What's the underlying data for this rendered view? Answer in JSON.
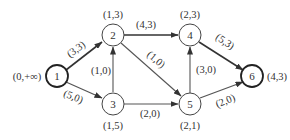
{
  "diagram": {
    "type": "directed-flow-network",
    "nodes": [
      {
        "id": "1",
        "label": "1",
        "mark": "(0,+∞)",
        "thick": true
      },
      {
        "id": "2",
        "label": "2",
        "mark": "(1,3)",
        "thick": false
      },
      {
        "id": "3",
        "label": "3",
        "mark": "(1,5)",
        "thick": false
      },
      {
        "id": "4",
        "label": "4",
        "mark": "(2,3)",
        "thick": false
      },
      {
        "id": "5",
        "label": "5",
        "mark": "(2,1)",
        "thick": false
      },
      {
        "id": "6",
        "label": "6",
        "mark": "(4,3)",
        "thick": true
      }
    ],
    "edges": [
      {
        "from": "1",
        "to": "2",
        "label": "(3,3)"
      },
      {
        "from": "1",
        "to": "3",
        "label": "(5,0)"
      },
      {
        "from": "3",
        "to": "2",
        "label": "(1,0)"
      },
      {
        "from": "2",
        "to": "4",
        "label": "(4,3)"
      },
      {
        "from": "2",
        "to": "5",
        "label": "(1,0)"
      },
      {
        "from": "3",
        "to": "5",
        "label": "(2,0)"
      },
      {
        "from": "5",
        "to": "4",
        "label": "(3,0)"
      },
      {
        "from": "4",
        "to": "6",
        "label": "(5,3)"
      },
      {
        "from": "5",
        "to": "6",
        "label": "(2,0)"
      }
    ]
  }
}
